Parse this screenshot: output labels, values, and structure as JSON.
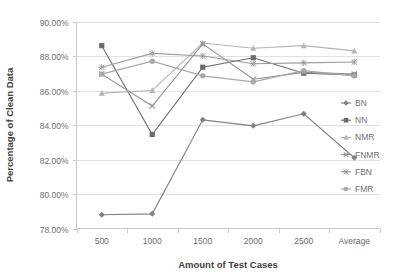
{
  "chart_data": {
    "type": "line",
    "title": "",
    "xlabel": "Amount of Test Cases",
    "ylabel": "Percentage of Clean Data",
    "categories": [
      "500",
      "1000",
      "1500",
      "2000",
      "2500",
      "Average"
    ],
    "ylim": [
      78.0,
      90.0
    ],
    "ytick_labels": [
      "90.00%",
      "88.00%",
      "86.00%",
      "84.00%",
      "82.00%",
      "80.00%",
      "78.00%"
    ],
    "ytick_values": [
      90.0,
      88.0,
      86.0,
      84.0,
      82.0,
      80.0,
      78.0
    ],
    "grid": true,
    "legend_position": "right",
    "series": [
      {
        "name": "BN",
        "marker": "diamond",
        "color": "#808080",
        "values": [
          78.8,
          78.85,
          84.3,
          83.95,
          84.65,
          82.1
        ]
      },
      {
        "name": "NN",
        "marker": "square",
        "color": "#6b6b6b",
        "values": [
          88.6,
          83.45,
          87.35,
          87.9,
          87.0,
          86.9
        ]
      },
      {
        "name": "NMR",
        "marker": "triangle",
        "color": "#b5b5b5",
        "values": [
          85.85,
          86.0,
          88.75,
          88.45,
          88.6,
          88.3
        ]
      },
      {
        "name": "FNMR",
        "marker": "cross",
        "color": "#8f8f8f",
        "values": [
          86.95,
          85.1,
          88.7,
          86.65,
          87.05,
          86.95
        ]
      },
      {
        "name": "FBN",
        "marker": "asterisk",
        "color": "#9c9c9c",
        "values": [
          87.35,
          88.15,
          88.0,
          87.55,
          87.6,
          87.65
        ]
      },
      {
        "name": "FMR",
        "marker": "circle",
        "color": "#a8a8a8",
        "values": [
          86.95,
          87.7,
          86.85,
          86.5,
          87.15,
          86.85
        ]
      }
    ]
  },
  "axes": {
    "y_title": "Percentage of Clean Data",
    "x_title": "Amount of Test Cases"
  },
  "legend": {
    "entries": [
      "BN",
      "NN",
      "NMR",
      "FNMR",
      "FBN",
      "FMR"
    ]
  },
  "colors": {
    "grid": "#e2e2e2",
    "axis": "#c8c8c8",
    "text": "#6e6e6e",
    "title_text": "#3f3f3f"
  }
}
